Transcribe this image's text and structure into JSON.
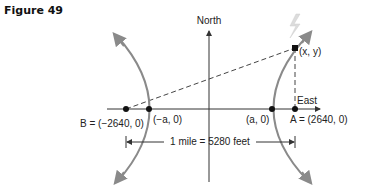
{
  "figure": {
    "title": "Figure 49",
    "axes": {
      "y_label": "North",
      "x_label": "East"
    },
    "points": {
      "B": {
        "label": "B = (−2640, 0)",
        "name": "B",
        "coords": "(−2640, 0)"
      },
      "A": {
        "label": "A = (2640, 0)",
        "name": "A",
        "coords": "(2640, 0)"
      },
      "neg_vertex": {
        "label": "(−a, 0)"
      },
      "pos_vertex": {
        "label": "(a, 0)"
      },
      "xy": {
        "label": "(x, y)"
      }
    },
    "dimension": {
      "label": "1 mile = 5280 feet"
    },
    "colors": {
      "hyperbola": "#8a8a8a",
      "axis": "#333333",
      "dashed": "#444444",
      "lightning": "#d9d9d9",
      "point": "#111111"
    }
  }
}
